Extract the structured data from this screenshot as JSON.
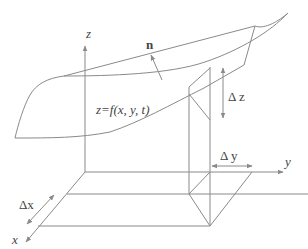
{
  "diagram": {
    "type": "3d-surface-volume-element",
    "colors": {
      "line": "#8a8a8a",
      "text": "#444444",
      "background": "#ffffff"
    },
    "labels": {
      "z_axis": "z",
      "y_axis": "y",
      "x_axis": "x",
      "normal": "n",
      "surface_equation": "z=f(x, y, t)",
      "delta_z": "Δ z",
      "delta_y": "Δ y",
      "delta_x": "Δx"
    }
  }
}
